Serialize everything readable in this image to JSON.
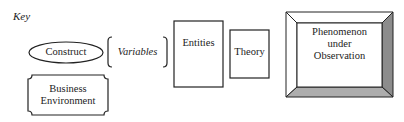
{
  "key": {
    "label": "Key"
  },
  "shapes": {
    "construct": {
      "label": "Construct",
      "shape": "ellipse"
    },
    "variables": {
      "label": "Variables",
      "shape": "brackets"
    },
    "entities": {
      "label": "Entities",
      "shape": "rectangle"
    },
    "theory": {
      "label": "Theory",
      "shape": "rectangle"
    },
    "business_environment": {
      "line1": "Business",
      "line2": "Environment",
      "shape": "notched-rectangle"
    },
    "phenomenon": {
      "line1": "Phenomenon",
      "line2": "under",
      "line3": "Observation",
      "shape": "beveled-rectangle"
    }
  },
  "colors": {
    "stroke": "#222222",
    "bevel_right": "#8c8c8c",
    "bevel_bottom": "#adadad",
    "bevel_light": "#ffffff",
    "background": "#ffffff"
  }
}
